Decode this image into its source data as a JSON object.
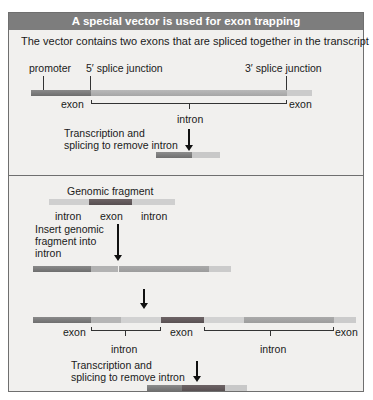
{
  "title": "A special vector is used for exon trapping",
  "top": {
    "caption": "The vector contains two exons that are spliced together in the transcript",
    "promoter": "promoter",
    "splice5": "5′ splice junction",
    "splice3": "3′ splice junction",
    "exon_left": "exon",
    "exon_right": "exon",
    "intron": "intron",
    "step": [
      "Transcription and",
      "splicing to remove intron"
    ]
  },
  "bottom": {
    "fragment_title": "Genomic fragment",
    "frag_labels": [
      "intron",
      "exon",
      "intron"
    ],
    "insert_step": [
      "Insert genomic",
      "fragment into",
      "intron"
    ],
    "labels": {
      "exon1": "exon",
      "exon2": "exon",
      "exon3": "exon",
      "intron1": "intron",
      "intron2": "intron"
    },
    "step": [
      "Transcription and",
      "splicing to remove intron"
    ]
  },
  "colors": {
    "header": "#7d7d7d",
    "panel": "#f1f0ee",
    "exon_dark": "#7a6f70",
    "exon_mid": "#9c9a9a",
    "intron_light": "#cfcfcf"
  }
}
